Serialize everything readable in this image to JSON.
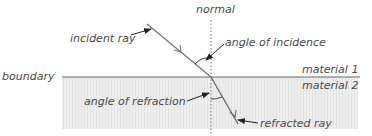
{
  "diagram": {
    "labels": {
      "normal": "normal",
      "incident_ray": "incident ray",
      "angle_of_incidence": "angle of incidence",
      "boundary": "boundary",
      "material_1": "material 1",
      "material_2": "material 2",
      "angle_of_refraction": "angle of refraction",
      "refracted_ray": "refracted ray"
    },
    "colors": {
      "background": "#ffffff",
      "material_2_fill": "#ebebeb",
      "boundary_line": "#6a6a6a",
      "ray": "#777777",
      "normal_line": "#8a8a8a",
      "pointer_arrow": "#222222",
      "text": "#4a4a4a"
    },
    "geometry": {
      "boundary_y": 77,
      "normal_x": 211,
      "incident_start": [
        147,
        24
      ],
      "point_of_incidence": [
        211,
        77
      ],
      "refracted_end": [
        238,
        124
      ]
    }
  }
}
